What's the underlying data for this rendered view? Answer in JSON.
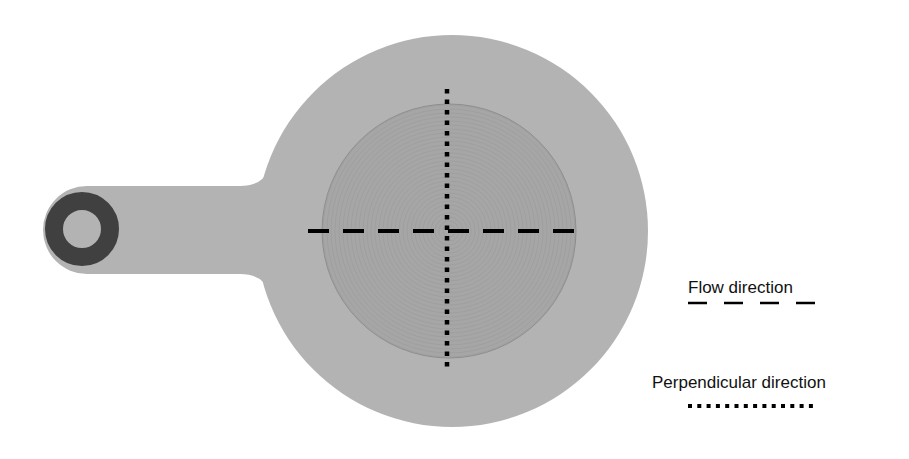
{
  "diagram": {
    "colors": {
      "background": "#ffffff",
      "body_fill": "#b3b3b3",
      "inner_disc_fill": "#a6a6a6",
      "inner_disc_rings": "#8f8f8f",
      "ring_dark": "#404040",
      "line": "#000000"
    },
    "body": {
      "outer_circle": {
        "cx": 452,
        "cy": 231,
        "r": 196
      },
      "handle": {
        "x_left": 41,
        "y_top": 186,
        "y_bottom": 274,
        "neck_x": 262
      },
      "mount_ring": {
        "cx": 82,
        "cy": 229,
        "r_outer": 37,
        "r_inner": 19
      }
    },
    "inner_disc": {
      "cx": 449,
      "cy": 231,
      "r": 127
    },
    "flow_line": {
      "x1": 308,
      "x2": 580,
      "y": 231,
      "style": "dashed"
    },
    "perpendicular_line": {
      "x": 447,
      "y1": 89,
      "y2": 370,
      "style": "dotted"
    }
  },
  "legend": {
    "flow": {
      "label": "Flow direction",
      "style": "dashed"
    },
    "perpendicular": {
      "label": "Perpendicular direction",
      "style": "dotted"
    }
  }
}
